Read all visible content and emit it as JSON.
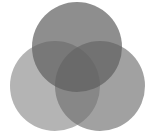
{
  "diagram": {
    "type": "venn",
    "set_count": 3,
    "background": "#ffffff",
    "sets": [
      {
        "id": "top",
        "label": "",
        "cx": 77,
        "cy": 47,
        "r": 45,
        "fill": "#5e5e5e",
        "opacity": 0.7
      },
      {
        "id": "left",
        "label": "",
        "cx": 55,
        "cy": 86,
        "r": 45,
        "fill": "#8c8c8c",
        "opacity": 0.65
      },
      {
        "id": "right",
        "label": "",
        "cx": 100,
        "cy": 86,
        "r": 45,
        "fill": "#6e6e6e",
        "opacity": 0.65
      }
    ],
    "colors": {
      "top_only": "#8a8a8a",
      "left_only": "#b4b4b4",
      "right_only": "#9c9c9c",
      "triple_overlap": "#484848"
    }
  }
}
